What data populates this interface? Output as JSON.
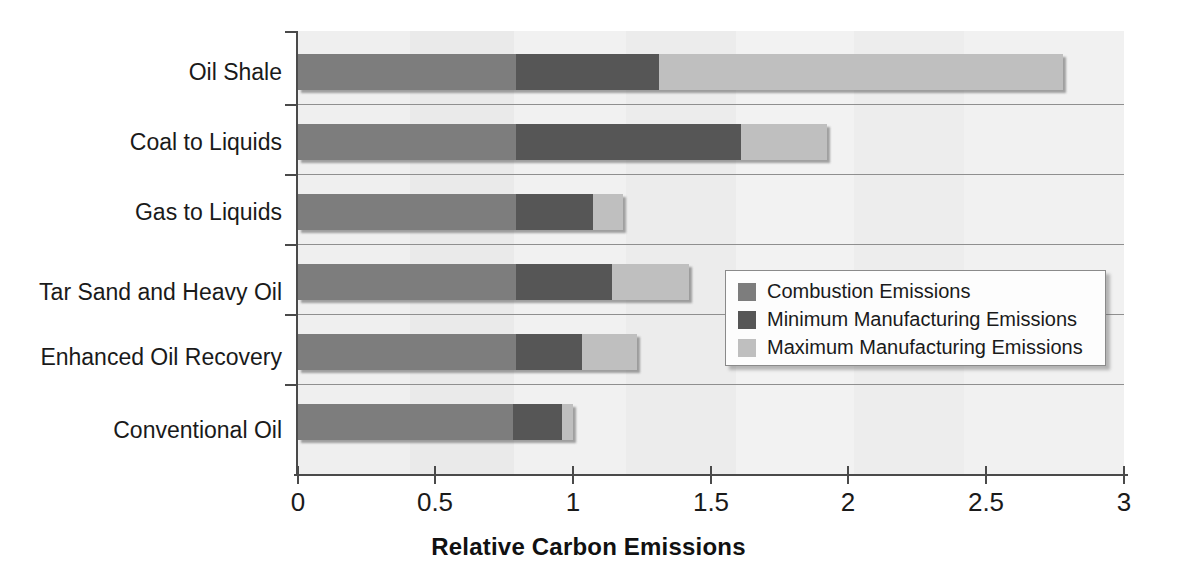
{
  "chart_data": {
    "type": "bar",
    "orientation": "horizontal",
    "stacked": true,
    "title": "",
    "xlabel": "Relative Carbon Emissions",
    "ylabel": "",
    "xlim": [
      0,
      3
    ],
    "xticks": [
      0,
      0.5,
      1,
      1.5,
      2,
      2.5,
      3
    ],
    "xticklabels": [
      "0",
      "0.5",
      "1",
      "1.5",
      "2",
      "2.5",
      "3"
    ],
    "grid": false,
    "legend_position": "center-right",
    "categories": [
      "Oil Shale",
      "Coal to Liquids",
      "Gas to Liquids",
      "Tar Sand and Heavy Oil",
      "Enhanced Oil Recovery",
      "Conventional Oil"
    ],
    "series": [
      {
        "name": "Combustion Emissions",
        "color": "#7d7d7d",
        "values": [
          0.79,
          0.79,
          0.79,
          0.79,
          0.79,
          0.78
        ]
      },
      {
        "name": "Minimum Manufacturing Emissions",
        "color": "#565656",
        "values": [
          0.52,
          0.82,
          0.28,
          0.35,
          0.24,
          0.18
        ]
      },
      {
        "name": "Maximum Manufacturing Emissions",
        "color": "#bfbfbf",
        "values": [
          1.47,
          0.31,
          0.11,
          0.28,
          0.2,
          0.04
        ]
      }
    ],
    "cumulative_totals": [
      2.78,
      1.92,
      1.18,
      1.42,
      1.23,
      1.0
    ],
    "segment_boundaries": [
      [
        0.79,
        1.31,
        2.78
      ],
      [
        0.79,
        1.61,
        1.92
      ],
      [
        0.79,
        1.07,
        1.18
      ],
      [
        0.79,
        1.14,
        1.42
      ],
      [
        0.79,
        1.03,
        1.23
      ],
      [
        0.78,
        0.96,
        1.0
      ]
    ]
  },
  "legend": {
    "items": [
      {
        "label": "Combustion Emissions",
        "color": "#7d7d7d"
      },
      {
        "label": "Minimum Manufacturing Emissions",
        "color": "#565656"
      },
      {
        "label": "Maximum Manufacturing Emissions",
        "color": "#bfbfbf"
      }
    ]
  },
  "axis": {
    "x_title": "Relative Carbon Emissions"
  }
}
